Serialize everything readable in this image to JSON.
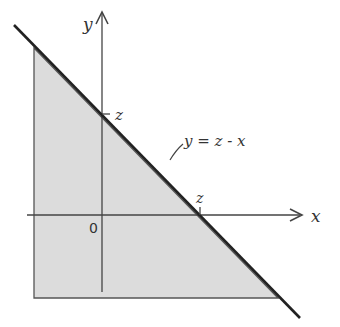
{
  "diagram": {
    "colors": {
      "shade": "#dcdcdc",
      "line": "#222222",
      "axis": "#444444",
      "text": "#333333"
    },
    "axes": {
      "x_label": "x",
      "y_label": "y",
      "origin_label": "0"
    },
    "ticks": {
      "y_intercept_label": "z",
      "x_intercept_label": "z"
    },
    "line_label": "y = z - x"
  }
}
